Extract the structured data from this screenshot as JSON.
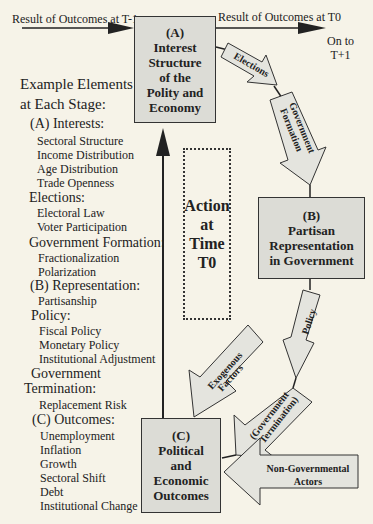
{
  "top_flow": {
    "left_arrow_label": "Result of Outcomes at T-1",
    "right_arrow_label": "Result of Outcomes at T0",
    "next_label_line1": "On to",
    "next_label_line2": "T+1"
  },
  "boxes": {
    "a": {
      "lines": [
        "(A)",
        "Interest",
        "Structure",
        "of the",
        "Polity and",
        "Economy"
      ]
    },
    "b": {
      "lines": [
        "(B)",
        "Partisan",
        "Representation",
        "in Government"
      ]
    },
    "c": {
      "lines": [
        "(C)",
        "Political",
        "and",
        "Economic",
        "Outcomes"
      ]
    }
  },
  "action_box": {
    "lines": [
      "Action",
      "at",
      "Time",
      "T0"
    ]
  },
  "arrows": {
    "elections": "Elections",
    "government_formation_line1": "Government",
    "government_formation_line2": "Formation",
    "policy": "Policy",
    "exogenous_line1": "Exogenous",
    "exogenous_line2": "Factors",
    "termination_line1": "(Government",
    "termination_line2": "Termination)",
    "non_governmental_line1": "Non-Governmental",
    "non_governmental_line2": "Actors"
  },
  "elements_list": {
    "title_line1": "Example Elements",
    "title_line2": "at Each Stage:",
    "items": [
      {
        "text": "(A) Interests:",
        "level": 1
      },
      {
        "text": "Sectoral Structure",
        "level": 2
      },
      {
        "text": "Income Distribution",
        "level": 2
      },
      {
        "text": "Age Distribution",
        "level": 2
      },
      {
        "text": "Trade Openness",
        "level": 2
      },
      {
        "text": "Elections:",
        "level": 1
      },
      {
        "text": "Electoral Law",
        "level": 2
      },
      {
        "text": "Voter Participation",
        "level": 2
      },
      {
        "text": "Government Formation:",
        "level": 1
      },
      {
        "text": "Fractionalization",
        "level": 2
      },
      {
        "text": "Polarization",
        "level": 2
      },
      {
        "text": "(B) Representation:",
        "level": 1
      },
      {
        "text": "Partisanship",
        "level": 2
      },
      {
        "text": "Policy:",
        "level": 1
      },
      {
        "text": "Fiscal Policy",
        "level": 2
      },
      {
        "text": "Monetary Policy",
        "level": 2
      },
      {
        "text": "Institutional Adjustment",
        "level": 2
      },
      {
        "text": "Government",
        "level": 1
      },
      {
        "text": "Termination:",
        "level": 0
      },
      {
        "text": "Replacement Risk",
        "level": 2
      },
      {
        "text": "(C) Outcomes:",
        "level": 1
      },
      {
        "text": "Unemployment",
        "level": 2
      },
      {
        "text": "Inflation",
        "level": 2
      },
      {
        "text": "Growth",
        "level": 2
      },
      {
        "text": "Sectoral Shift",
        "level": 2
      },
      {
        "text": "Debt",
        "level": 2
      },
      {
        "text": "Institutional Change",
        "level": 2
      }
    ]
  },
  "colors": {
    "background": "#f6f3e8",
    "box_fill": "#dcdcd6",
    "arrow_fill": "#e4e4de",
    "stroke": "#333333"
  }
}
